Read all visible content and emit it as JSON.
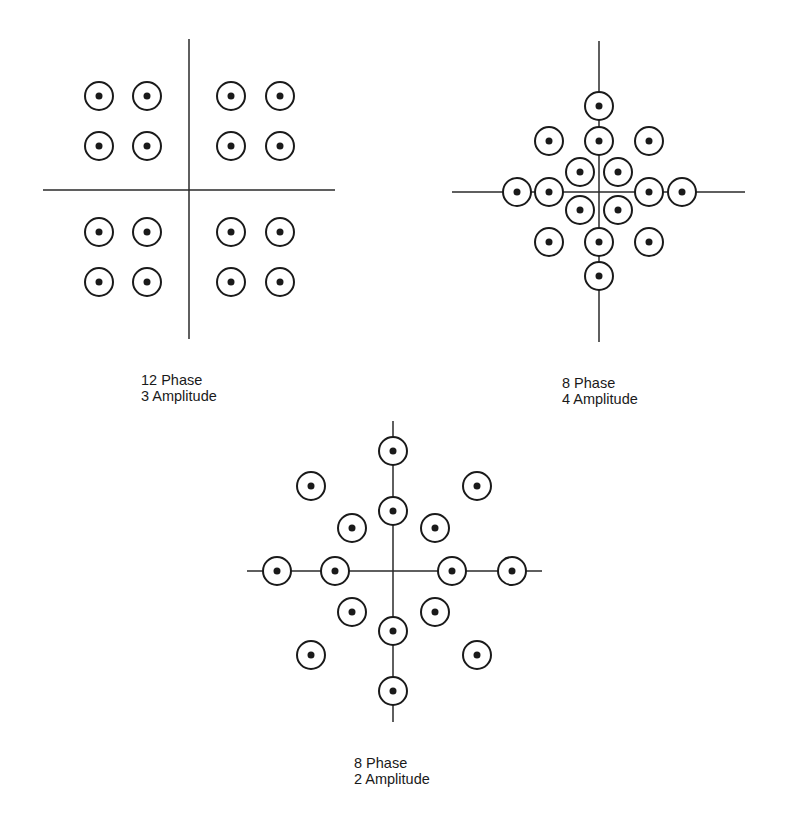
{
  "colors": {
    "background": "#ffffff",
    "ink": "#1a1a1a",
    "axis": "#2a2a2a"
  },
  "style": {
    "circle_radius": 14,
    "circle_stroke": 2,
    "dot_radius": 3.5,
    "axis_stroke": 1.5
  },
  "diagrams": [
    {
      "id": "qam-12-phase-3-amplitude",
      "label_line1": "12 Phase",
      "label_line2": "3 Amplitude",
      "label_pos": {
        "x": 141,
        "y": 372
      },
      "axes": {
        "h": {
          "x1": 43,
          "x2": 335,
          "y": 190
        },
        "v": {
          "x": 189,
          "y1": 39,
          "y2": 339
        }
      },
      "points": [
        [
          99,
          96
        ],
        [
          147,
          96
        ],
        [
          231,
          96
        ],
        [
          280,
          96
        ],
        [
          99,
          146
        ],
        [
          147,
          146
        ],
        [
          231,
          146
        ],
        [
          280,
          146
        ],
        [
          99,
          232
        ],
        [
          147,
          232
        ],
        [
          231,
          232
        ],
        [
          280,
          232
        ],
        [
          99,
          282
        ],
        [
          147,
          282
        ],
        [
          231,
          282
        ],
        [
          280,
          282
        ]
      ]
    },
    {
      "id": "qam-8-phase-4-amplitude",
      "label_line1": "8 Phase",
      "label_line2": "4 Amplitude",
      "label_pos": {
        "x": 562,
        "y": 375
      },
      "axes": {
        "h": {
          "x1": 452,
          "x2": 745,
          "y": 192
        },
        "v": {
          "x": 599,
          "y1": 41,
          "y2": 342
        }
      },
      "points": [
        [
          599,
          106
        ],
        [
          549,
          141
        ],
        [
          599,
          141
        ],
        [
          649,
          141
        ],
        [
          580,
          172
        ],
        [
          618,
          172
        ],
        [
          517,
          192
        ],
        [
          549,
          192
        ],
        [
          649,
          192
        ],
        [
          682,
          192
        ],
        [
          580,
          210
        ],
        [
          618,
          210
        ],
        [
          549,
          242
        ],
        [
          599,
          242
        ],
        [
          649,
          242
        ],
        [
          599,
          276
        ]
      ]
    },
    {
      "id": "qam-8-phase-2-amplitude",
      "label_line1": "8 Phase",
      "label_line2": "2 Amplitude",
      "label_pos": {
        "x": 354,
        "y": 755
      },
      "axes": {
        "h": {
          "x1": 247,
          "x2": 542,
          "y": 571
        },
        "v": {
          "x": 393,
          "y1": 421,
          "y2": 722
        }
      },
      "points": [
        [
          393,
          451
        ],
        [
          311,
          486
        ],
        [
          477,
          486
        ],
        [
          393,
          511
        ],
        [
          352,
          528
        ],
        [
          435,
          528
        ],
        [
          277,
          571
        ],
        [
          335,
          571
        ],
        [
          452,
          571
        ],
        [
          512,
          571
        ],
        [
          352,
          612
        ],
        [
          435,
          612
        ],
        [
          393,
          631
        ],
        [
          311,
          655
        ],
        [
          477,
          655
        ],
        [
          393,
          691
        ]
      ]
    }
  ]
}
